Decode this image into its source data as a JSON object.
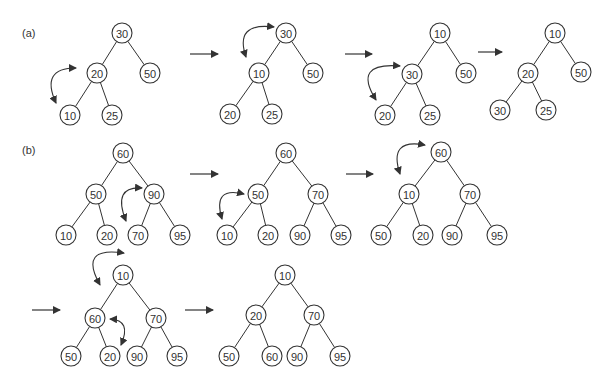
{
  "panels": [
    {
      "id": "a",
      "label": "(a)",
      "label_pos": [
        22,
        37
      ],
      "trees": [
        {
          "nodes": [
            {
              "value": "30",
              "x": 122,
              "y": 33
            },
            {
              "value": "20",
              "x": 97,
              "y": 73
            },
            {
              "value": "50",
              "x": 150,
              "y": 73
            },
            {
              "value": "10",
              "x": 70,
              "y": 115
            },
            {
              "value": "25",
              "x": 112,
              "y": 115
            }
          ],
          "edges": [
            [
              0,
              1
            ],
            [
              0,
              2
            ],
            [
              1,
              3
            ],
            [
              1,
              4
            ]
          ],
          "swap": {
            "from": [
              76,
              68
            ],
            "to": [
              56,
              103
            ],
            "ctrl": [
              40,
              68
            ]
          }
        },
        {
          "nodes": [
            {
              "value": "30",
              "x": 286,
              "y": 33
            },
            {
              "value": "10",
              "x": 259,
              "y": 73
            },
            {
              "value": "50",
              "x": 313,
              "y": 73
            },
            {
              "value": "20",
              "x": 230,
              "y": 114
            },
            {
              "value": "25",
              "x": 272,
              "y": 114
            }
          ],
          "edges": [
            [
              0,
              1
            ],
            [
              0,
              2
            ],
            [
              1,
              3
            ],
            [
              1,
              4
            ]
          ],
          "swap": {
            "from": [
              274,
              27
            ],
            "to": [
              246,
              57
            ],
            "ctrl": [
              234,
              22
            ]
          }
        },
        {
          "nodes": [
            {
              "value": "10",
              "x": 440,
              "y": 33
            },
            {
              "value": "30",
              "x": 412,
              "y": 74
            },
            {
              "value": "50",
              "x": 466,
              "y": 73
            },
            {
              "value": "20",
              "x": 385,
              "y": 115
            },
            {
              "value": "25",
              "x": 430,
              "y": 115
            }
          ],
          "edges": [
            [
              0,
              1
            ],
            [
              0,
              2
            ],
            [
              1,
              3
            ],
            [
              1,
              4
            ]
          ],
          "swap": {
            "from": [
              400,
              66
            ],
            "to": [
              376,
              100
            ],
            "ctrl": [
              352,
              62
            ]
          }
        },
        {
          "nodes": [
            {
              "value": "10",
              "x": 555,
              "y": 33
            },
            {
              "value": "20",
              "x": 528,
              "y": 73
            },
            {
              "value": "50",
              "x": 581,
              "y": 72
            },
            {
              "value": "30",
              "x": 500,
              "y": 110
            },
            {
              "value": "25",
              "x": 546,
              "y": 110
            }
          ],
          "edges": [
            [
              0,
              1
            ],
            [
              0,
              2
            ],
            [
              1,
              3
            ],
            [
              1,
              4
            ]
          ],
          "swap": null
        }
      ],
      "arrows": [
        {
          "x1": 190,
          "y1": 54,
          "x2": 218,
          "y2": 54
        },
        {
          "x1": 345,
          "y1": 54,
          "x2": 372,
          "y2": 54
        },
        {
          "x1": 478,
          "y1": 52,
          "x2": 502,
          "y2": 52
        }
      ]
    },
    {
      "id": "b",
      "label": "(b)",
      "label_pos": [
        22,
        154
      ],
      "trees": [
        {
          "nodes": [
            {
              "value": "60",
              "x": 123,
              "y": 153
            },
            {
              "value": "50",
              "x": 96,
              "y": 194
            },
            {
              "value": "90",
              "x": 154,
              "y": 194
            },
            {
              "value": "10",
              "x": 66,
              "y": 235
            },
            {
              "value": "20",
              "x": 107,
              "y": 235
            },
            {
              "value": "70",
              "x": 138,
              "y": 235
            },
            {
              "value": "95",
              "x": 180,
              "y": 235
            }
          ],
          "edges": [
            [
              0,
              1
            ],
            [
              0,
              2
            ],
            [
              1,
              3
            ],
            [
              1,
              4
            ],
            [
              2,
              5
            ],
            [
              2,
              6
            ]
          ],
          "swap": {
            "from": [
              142,
              188
            ],
            "to": [
              126,
              221
            ],
            "ctrl": [
              112,
              186
            ]
          }
        },
        {
          "nodes": [
            {
              "value": "60",
              "x": 286,
              "y": 153
            },
            {
              "value": "50",
              "x": 258,
              "y": 194
            },
            {
              "value": "70",
              "x": 318,
              "y": 194
            },
            {
              "value": "10",
              "x": 227,
              "y": 235
            },
            {
              "value": "20",
              "x": 268,
              "y": 235
            },
            {
              "value": "90",
              "x": 300,
              "y": 235
            },
            {
              "value": "95",
              "x": 341,
              "y": 235
            }
          ],
          "edges": [
            [
              0,
              1
            ],
            [
              0,
              2
            ],
            [
              1,
              3
            ],
            [
              1,
              4
            ],
            [
              2,
              5
            ],
            [
              2,
              6
            ]
          ],
          "swap": {
            "from": [
              244,
              194
            ],
            "to": [
              222,
              219
            ],
            "ctrl": [
              212,
              186
            ]
          }
        },
        {
          "nodes": [
            {
              "value": "60",
              "x": 441,
              "y": 152
            },
            {
              "value": "10",
              "x": 409,
              "y": 194
            },
            {
              "value": "70",
              "x": 470,
              "y": 194
            },
            {
              "value": "50",
              "x": 381,
              "y": 235
            },
            {
              "value": "20",
              "x": 423,
              "y": 235
            },
            {
              "value": "90",
              "x": 452,
              "y": 235
            },
            {
              "value": "95",
              "x": 497,
              "y": 235
            }
          ],
          "edges": [
            [
              0,
              1
            ],
            [
              0,
              2
            ],
            [
              1,
              3
            ],
            [
              1,
              4
            ],
            [
              2,
              5
            ],
            [
              2,
              6
            ]
          ],
          "swap": {
            "from": [
              425,
              145
            ],
            "to": [
              400,
              174
            ],
            "ctrl": [
              388,
              138
            ]
          }
        },
        {
          "nodes": [
            {
              "value": "10",
              "x": 123,
              "y": 275
            },
            {
              "value": "60",
              "x": 95,
              "y": 318
            },
            {
              "value": "70",
              "x": 156,
              "y": 318
            },
            {
              "value": "50",
              "x": 71,
              "y": 356
            },
            {
              "value": "20",
              "x": 110,
              "y": 356
            },
            {
              "value": "90",
              "x": 137,
              "y": 356
            },
            {
              "value": "95",
              "x": 177,
              "y": 356
            }
          ],
          "edges": [
            [
              0,
              1
            ],
            [
              0,
              2
            ],
            [
              1,
              3
            ],
            [
              1,
              4
            ],
            [
              2,
              5
            ],
            [
              2,
              6
            ]
          ],
          "swap": {
            "from": [
              124,
              253
            ],
            "to": [
              100,
              285
            ],
            "ctrl": [
              78,
              246
            ]
          },
          "swap2": {
            "from": [
              110,
              319
            ],
            "to": [
              121,
              345
            ],
            "ctrl": [
              132,
              320
            ]
          }
        },
        {
          "nodes": [
            {
              "value": "10",
              "x": 285,
              "y": 275
            },
            {
              "value": "20",
              "x": 256,
              "y": 315
            },
            {
              "value": "70",
              "x": 314,
              "y": 315
            },
            {
              "value": "50",
              "x": 229,
              "y": 356
            },
            {
              "value": "60",
              "x": 272,
              "y": 356
            },
            {
              "value": "90",
              "x": 297,
              "y": 356
            },
            {
              "value": "95",
              "x": 340,
              "y": 356
            }
          ],
          "edges": [
            [
              0,
              1
            ],
            [
              0,
              2
            ],
            [
              1,
              3
            ],
            [
              1,
              4
            ],
            [
              2,
              5
            ],
            [
              2,
              6
            ]
          ],
          "swap": null
        }
      ],
      "arrows": [
        {
          "x1": 190,
          "y1": 174,
          "x2": 218,
          "y2": 174
        },
        {
          "x1": 346,
          "y1": 174,
          "x2": 373,
          "y2": 174
        },
        {
          "x1": 32,
          "y1": 310,
          "x2": 60,
          "y2": 310
        },
        {
          "x1": 185,
          "y1": 310,
          "x2": 213,
          "y2": 310
        }
      ]
    }
  ],
  "style": {
    "node_radius": 10,
    "stroke_color": "#333333",
    "background": "#ffffff"
  }
}
